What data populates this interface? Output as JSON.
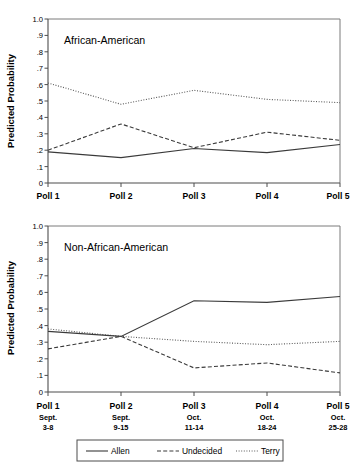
{
  "figure": {
    "axis_title": "Predicted Probability",
    "legend": {
      "entries": [
        {
          "label": "Allen",
          "style": "solid"
        },
        {
          "label": "Undecided",
          "style": "dashed"
        },
        {
          "label": "Terry",
          "style": "dotted"
        }
      ]
    }
  },
  "chart_data": [
    {
      "type": "line",
      "title": "African-American",
      "xlabel": "",
      "ylabel": "Predicted Probability",
      "ylim": [
        0,
        1.0
      ],
      "yticks": [
        0,
        0.1,
        0.2,
        0.3,
        0.4,
        0.5,
        0.6,
        0.7,
        0.8,
        0.9,
        1.0
      ],
      "ytick_labels": [
        "0",
        ".1",
        ".2",
        ".3",
        ".4",
        ".5",
        ".6",
        ".7",
        ".8",
        ".9",
        "1.0"
      ],
      "categories": [
        "Poll 1",
        "Poll 2",
        "Poll 3",
        "Poll 4",
        "Poll 5"
      ],
      "grid": false,
      "legend_position": "below-figure",
      "series": [
        {
          "name": "Allen",
          "style": "solid",
          "values": [
            0.19,
            0.155,
            0.21,
            0.185,
            0.235
          ]
        },
        {
          "name": "Undecided",
          "style": "dashed",
          "values": [
            0.2,
            0.36,
            0.215,
            0.31,
            0.26
          ]
        },
        {
          "name": "Terry",
          "style": "dotted",
          "values": [
            0.61,
            0.48,
            0.565,
            0.51,
            0.49
          ]
        }
      ]
    },
    {
      "type": "line",
      "title": "Non-African-American",
      "xlabel": "",
      "ylabel": "Predicted Probability",
      "ylim": [
        0,
        1.0
      ],
      "yticks": [
        0,
        0.1,
        0.2,
        0.3,
        0.4,
        0.5,
        0.6,
        0.7,
        0.8,
        0.9,
        1.0
      ],
      "ytick_labels": [
        "0",
        ".1",
        ".2",
        ".3",
        ".4",
        ".5",
        ".6",
        ".7",
        ".8",
        ".9",
        "1.0"
      ],
      "categories": [
        "Poll 1",
        "Poll 2",
        "Poll 3",
        "Poll 4",
        "Poll 5"
      ],
      "category_dates": [
        {
          "month": "Sept.",
          "days": "3-8"
        },
        {
          "month": "Sept.",
          "days": "9-15"
        },
        {
          "month": "Oct.",
          "days": "11-14"
        },
        {
          "month": "Oct.",
          "days": "18-24"
        },
        {
          "month": "Oct.",
          "days": "25-28"
        }
      ],
      "grid": false,
      "legend_position": "below-figure",
      "series": [
        {
          "name": "Allen",
          "style": "solid",
          "values": [
            0.365,
            0.335,
            0.55,
            0.54,
            0.575
          ]
        },
        {
          "name": "Undecided",
          "style": "dashed",
          "values": [
            0.26,
            0.335,
            0.145,
            0.175,
            0.115
          ]
        },
        {
          "name": "Terry",
          "style": "dotted",
          "values": [
            0.38,
            0.335,
            0.305,
            0.285,
            0.305
          ]
        }
      ]
    }
  ]
}
